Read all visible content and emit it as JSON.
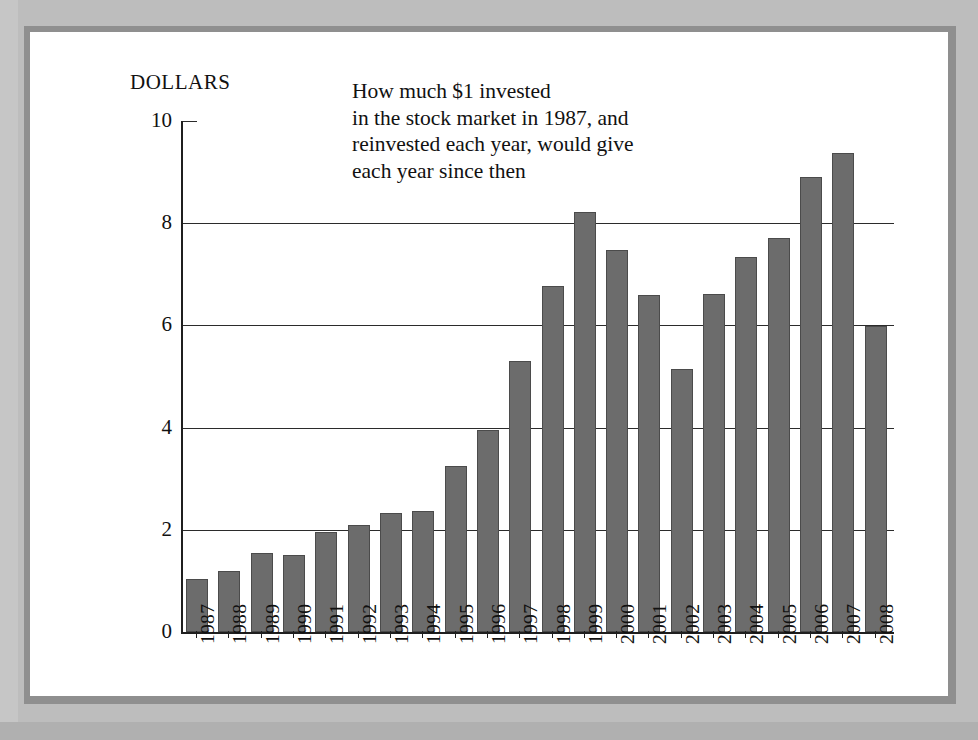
{
  "chart_data": {
    "type": "bar",
    "title": "",
    "annotation": [
      "How much $1 invested",
      "in the stock market in 1987, and",
      "reinvested each year, would give",
      "each year since then"
    ],
    "ylabel": "Dollars",
    "ylabel_display": "DOLLARS",
    "xlabel": "",
    "ylim": [
      0,
      10
    ],
    "yticks": [
      0,
      2,
      4,
      6,
      8,
      10
    ],
    "ytick_labels": [
      "0",
      "2",
      "4",
      "6",
      "8",
      "10"
    ],
    "gridlines": [
      2,
      4,
      6,
      8
    ],
    "grid": true,
    "legend": "none",
    "bar_color": "#6c6c6c",
    "bar_edge_color": "#4b4b4b",
    "axis_color": "#1f1f1f",
    "background_color": "#ffffff",
    "page_background_color": "#bdbdbd",
    "categories": [
      "1987",
      "1988",
      "1989",
      "1990",
      "1991",
      "1992",
      "1993",
      "1994",
      "1995",
      "1996",
      "1997",
      "1998",
      "1999",
      "2000",
      "2001",
      "2002",
      "2003",
      "2004",
      "2005",
      "2006",
      "2007",
      "2008"
    ],
    "values": [
      1.03,
      1.2,
      1.55,
      1.5,
      1.95,
      2.1,
      2.32,
      2.37,
      3.25,
      3.95,
      5.3,
      6.78,
      8.22,
      7.47,
      6.6,
      5.15,
      6.62,
      7.33,
      7.72,
      8.9,
      9.38,
      5.98
    ]
  }
}
